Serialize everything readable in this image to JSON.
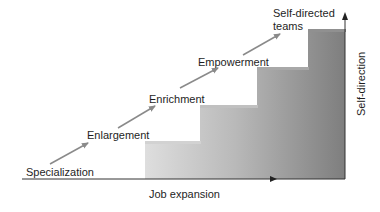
{
  "diagram": {
    "type": "staircase",
    "stages": [
      {
        "label": "Specialization"
      },
      {
        "label": "Enlargement"
      },
      {
        "label": "Enrichment"
      },
      {
        "label": "Empowerment"
      },
      {
        "label": "Self-directed",
        "label_line2": "teams"
      }
    ],
    "x_axis_label": "Job expansion",
    "y_axis_label": "Self-direction",
    "colors": {
      "step_light": "#dcdcdc",
      "step_dark": "#808080",
      "arrow": "#8a8a8a",
      "axis": "#333333"
    }
  }
}
